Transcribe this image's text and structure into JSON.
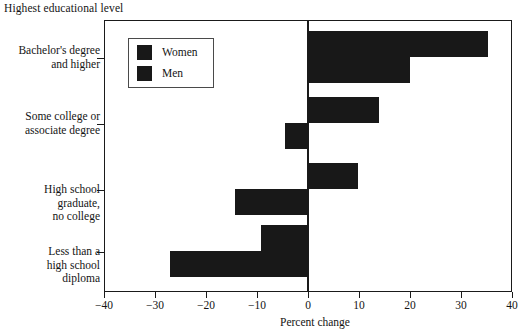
{
  "chart_data": {
    "type": "bar",
    "orientation": "horizontal",
    "title": "",
    "ylabel": "Highest educational level",
    "xlabel": "Percent change",
    "xlim": [
      -40,
      40
    ],
    "xticks": [
      -40,
      -30,
      -20,
      -10,
      0,
      10,
      20,
      30,
      40
    ],
    "xtick_labels": [
      "−40",
      "−30",
      "−20",
      "−10",
      "0",
      "10",
      "20",
      "30",
      "40"
    ],
    "grid": false,
    "legend_position": "upper-left-inside",
    "categories": [
      "Bachelor's degree\nand higher",
      "Some college or\nassociate degree",
      "High school\ngraduate,\nno college",
      "Less than a\nhigh school\ndiploma"
    ],
    "series": [
      {
        "name": "Women",
        "color": "#181818",
        "values": [
          35.3,
          14.0,
          9.8,
          -9.2
        ]
      },
      {
        "name": "Men",
        "color": "#181818",
        "values": [
          20.0,
          -4.5,
          -14.3,
          -27.0
        ]
      }
    ]
  },
  "legend": {
    "items": [
      {
        "label": "Women"
      },
      {
        "label": "Men"
      }
    ]
  },
  "axis": {
    "y_title": "Highest educational level",
    "x_title": "Percent change"
  }
}
